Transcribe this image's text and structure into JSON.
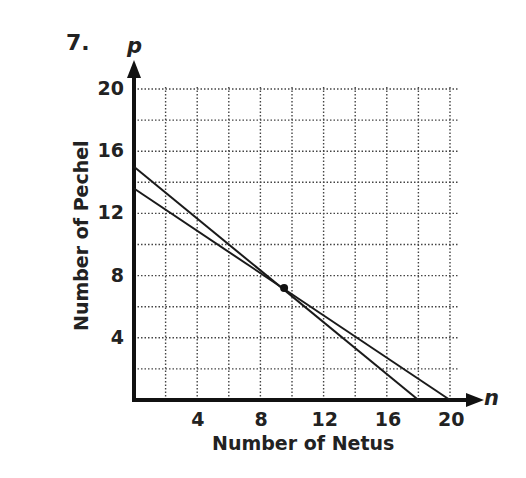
{
  "problem_number": "7.",
  "chart_data": {
    "type": "line",
    "title": "",
    "xlabel": "Number of Netus",
    "ylabel": "Number of Pechel",
    "x_var": "n",
    "y_var": "p",
    "xlim": [
      0,
      21
    ],
    "ylim": [
      0,
      21
    ],
    "x_ticks": [
      4,
      8,
      12,
      16,
      20
    ],
    "y_ticks": [
      4,
      8,
      12,
      16,
      20
    ],
    "grid": {
      "on": true,
      "step": 2,
      "style": "dotted"
    },
    "series": [
      {
        "name": "line-1",
        "points": [
          [
            0,
            15
          ],
          [
            18,
            0
          ]
        ]
      },
      {
        "name": "line-2",
        "points": [
          [
            0,
            13.6
          ],
          [
            20,
            0
          ]
        ]
      }
    ],
    "annotations": [
      {
        "type": "point",
        "label": "intersection",
        "x": 9.5,
        "y": 7.2
      }
    ]
  }
}
